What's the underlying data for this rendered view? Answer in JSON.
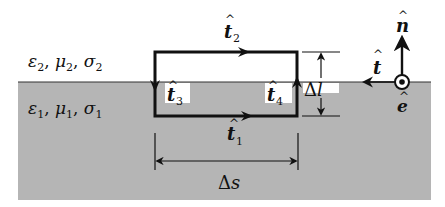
{
  "figure": {
    "regions": {
      "upper": {
        "label": "ε₂, μ₂, σ₂",
        "parts": [
          {
            "sym": "ε",
            "sub": "2"
          },
          {
            "sym": "μ",
            "sub": "2"
          },
          {
            "sym": "σ",
            "sub": "2"
          }
        ],
        "color": "#ffffff"
      },
      "lower": {
        "label": "ε₁, μ₁, σ₁",
        "parts": [
          {
            "sym": "ε",
            "sub": "1"
          },
          {
            "sym": "μ",
            "sub": "1"
          },
          {
            "sym": "σ",
            "sub": "1"
          }
        ],
        "color": "#b5b5b5"
      }
    },
    "loop_tangents": {
      "t1": {
        "sym": "t",
        "sub": "1",
        "direction": "right"
      },
      "t2": {
        "sym": "t",
        "sub": "2",
        "direction": "left"
      },
      "t3": {
        "sym": "t",
        "sub": "3",
        "direction": "down"
      },
      "t4": {
        "sym": "t",
        "sub": "4",
        "direction": "up"
      }
    },
    "dimensions": {
      "height": {
        "delta": "Δ",
        "var": "l"
      },
      "width": {
        "delta": "Δ",
        "var": "s"
      }
    },
    "frame_vectors": {
      "normal": {
        "sym": "n",
        "direction": "up"
      },
      "tangent": {
        "sym": "t",
        "direction": "left"
      },
      "binormal": {
        "sym": "e",
        "direction": "out-of-page"
      }
    },
    "colors": {
      "ink": "#111111",
      "medium_gray": "#b5b5b5",
      "background": "#ffffff"
    }
  }
}
